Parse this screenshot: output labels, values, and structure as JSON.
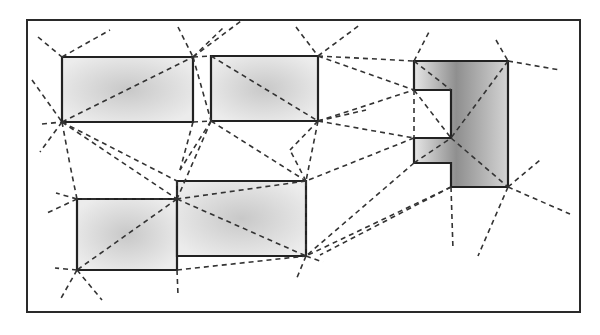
{
  "diagram": {
    "canvas": {
      "width": 600,
      "height": 335
    },
    "colors": {
      "frame": "#2a2a2a",
      "obstacle_stroke": "#222222",
      "obstacle_fill_light": "#d9d9d9",
      "obstacle_fill_dark": "#9a9a9a",
      "edge": "#333333",
      "background": "#ffffff"
    },
    "frame": {
      "x": 27,
      "y": 20,
      "width": 553,
      "height": 292
    },
    "obstacles": [
      {
        "id": "rect-a",
        "shade": "light",
        "points": [
          [
            62,
            57
          ],
          [
            193,
            57
          ],
          [
            193,
            122
          ],
          [
            62,
            122
          ]
        ]
      },
      {
        "id": "rect-b",
        "shade": "light",
        "points": [
          [
            211,
            56
          ],
          [
            318,
            56
          ],
          [
            318,
            121
          ],
          [
            211,
            121
          ]
        ]
      },
      {
        "id": "c-shape",
        "shade": "dark",
        "points": [
          [
            414,
            61
          ],
          [
            508,
            61
          ],
          [
            508,
            187
          ],
          [
            451,
            187
          ],
          [
            451,
            163
          ],
          [
            414,
            163
          ],
          [
            414,
            138
          ],
          [
            451,
            138
          ],
          [
            451,
            90
          ],
          [
            414,
            90
          ]
        ]
      },
      {
        "id": "rect-d",
        "shade": "light",
        "points": [
          [
            77,
            199
          ],
          [
            177,
            199
          ],
          [
            177,
            270
          ],
          [
            77,
            270
          ]
        ]
      },
      {
        "id": "rect-e",
        "shade": "light",
        "points": [
          [
            177,
            181
          ],
          [
            306,
            181
          ],
          [
            306,
            256
          ],
          [
            177,
            256
          ]
        ]
      }
    ],
    "edges": [
      [
        [
          38,
          37
        ],
        [
          62,
          57
        ]
      ],
      [
        [
          62,
          57
        ],
        [
          110,
          30
        ]
      ],
      [
        [
          32,
          80
        ],
        [
          62,
          122
        ]
      ],
      [
        [
          42,
          124
        ],
        [
          62,
          122
        ]
      ],
      [
        [
          62,
          122
        ],
        [
          193,
          57
        ]
      ],
      [
        [
          62,
          122
        ],
        [
          40,
          152
        ]
      ],
      [
        [
          62,
          122
        ],
        [
          70,
          165
        ]
      ],
      [
        [
          62,
          122
        ],
        [
          177,
          199
        ]
      ],
      [
        [
          62,
          122
        ],
        [
          177,
          181
        ]
      ],
      [
        [
          178,
          27
        ],
        [
          193,
          57
        ]
      ],
      [
        [
          193,
          57
        ],
        [
          224,
          27
        ]
      ],
      [
        [
          193,
          57
        ],
        [
          241,
          21
        ]
      ],
      [
        [
          193,
          57
        ],
        [
          211,
          56
        ]
      ],
      [
        [
          193,
          122
        ],
        [
          211,
          121
        ]
      ],
      [
        [
          193,
          57
        ],
        [
          211,
          121
        ]
      ],
      [
        [
          193,
          122
        ],
        [
          180,
          170
        ]
      ],
      [
        [
          211,
          121
        ],
        [
          180,
          170
        ]
      ],
      [
        [
          211,
          56
        ],
        [
          318,
          121
        ]
      ],
      [
        [
          211,
          121
        ],
        [
          306,
          181
        ]
      ],
      [
        [
          211,
          121
        ],
        [
          177,
          199
        ]
      ],
      [
        [
          296,
          27
        ],
        [
          318,
          56
        ]
      ],
      [
        [
          318,
          56
        ],
        [
          361,
          24
        ]
      ],
      [
        [
          318,
          56
        ],
        [
          414,
          61
        ]
      ],
      [
        [
          318,
          56
        ],
        [
          414,
          90
        ]
      ],
      [
        [
          318,
          121
        ],
        [
          414,
          90
        ]
      ],
      [
        [
          318,
          121
        ],
        [
          414,
          138
        ]
      ],
      [
        [
          318,
          121
        ],
        [
          306,
          181
        ]
      ],
      [
        [
          318,
          121
        ],
        [
          366,
          110
        ]
      ],
      [
        [
          414,
          61
        ],
        [
          430,
          30
        ]
      ],
      [
        [
          496,
          40
        ],
        [
          508,
          61
        ]
      ],
      [
        [
          508,
          61
        ],
        [
          560,
          70
        ]
      ],
      [
        [
          414,
          61
        ],
        [
          451,
          90
        ]
      ],
      [
        [
          508,
          61
        ],
        [
          451,
          138
        ]
      ],
      [
        [
          414,
          90
        ],
        [
          451,
          138
        ]
      ],
      [
        [
          414,
          138
        ],
        [
          306,
          181
        ]
      ],
      [
        [
          414,
          163
        ],
        [
          306,
          256
        ]
      ],
      [
        [
          414,
          163
        ],
        [
          451,
          138
        ]
      ],
      [
        [
          451,
          138
        ],
        [
          508,
          187
        ]
      ],
      [
        [
          414,
          90
        ],
        [
          414,
          138
        ]
      ],
      [
        [
          508,
          187
        ],
        [
          540,
          160
        ]
      ],
      [
        [
          508,
          187
        ],
        [
          570,
          214
        ]
      ],
      [
        [
          508,
          187
        ],
        [
          478,
          256
        ]
      ],
      [
        [
          451,
          187
        ],
        [
          453,
          250
        ]
      ],
      [
        [
          451,
          187
        ],
        [
          306,
          256
        ]
      ],
      [
        [
          451,
          187
        ],
        [
          320,
          255
        ]
      ],
      [
        [
          306,
          181
        ],
        [
          177,
          199
        ]
      ],
      [
        [
          306,
          181
        ],
        [
          306,
          256
        ]
      ],
      [
        [
          177,
          181
        ],
        [
          177,
          199
        ]
      ],
      [
        [
          177,
          199
        ],
        [
          77,
          199
        ]
      ],
      [
        [
          77,
          199
        ],
        [
          47,
          213
        ]
      ],
      [
        [
          77,
          199
        ],
        [
          56,
          193
        ]
      ],
      [
        [
          77,
          199
        ],
        [
          70,
          165
        ]
      ],
      [
        [
          177,
          199
        ],
        [
          77,
          270
        ]
      ],
      [
        [
          177,
          199
        ],
        [
          306,
          256
        ]
      ],
      [
        [
          77,
          270
        ],
        [
          55,
          268
        ]
      ],
      [
        [
          77,
          270
        ],
        [
          60,
          300
        ]
      ],
      [
        [
          77,
          270
        ],
        [
          102,
          300
        ]
      ],
      [
        [
          177,
          270
        ],
        [
          306,
          256
        ]
      ],
      [
        [
          177,
          270
        ],
        [
          178,
          295
        ]
      ],
      [
        [
          306,
          256
        ],
        [
          323,
          262
        ]
      ],
      [
        [
          306,
          256
        ],
        [
          296,
          280
        ]
      ],
      [
        [
          318,
          121
        ],
        [
          290,
          150
        ]
      ],
      [
        [
          306,
          181
        ],
        [
          290,
          150
        ]
      ]
    ]
  }
}
